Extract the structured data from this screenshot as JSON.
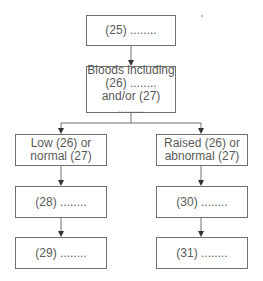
{
  "diagram": {
    "type": "flowchart",
    "nodes": [
      {
        "id": "n25",
        "label": "(25) ........"
      },
      {
        "id": "bloods",
        "line1": "Bloods including",
        "line2": "(26) ........",
        "line3": "and/or (27) ........"
      },
      {
        "id": "low",
        "line1": "Low (26) or",
        "line2": "normal (27)"
      },
      {
        "id": "raised",
        "line1": "Raised (26) or",
        "line2": "abnormal (27)"
      },
      {
        "id": "n28",
        "label": "(28) ........"
      },
      {
        "id": "n29",
        "label": "(29) ........"
      },
      {
        "id": "n30",
        "label": "(30) ........"
      },
      {
        "id": "n31",
        "label": "(31) ........"
      }
    ],
    "edges": [
      [
        "n25",
        "bloods"
      ],
      [
        "bloods",
        "low"
      ],
      [
        "bloods",
        "raised"
      ],
      [
        "low",
        "n28"
      ],
      [
        "n28",
        "n29"
      ],
      [
        "raised",
        "n30"
      ],
      [
        "n30",
        "n31"
      ]
    ],
    "colors": {
      "border": "#707070",
      "text": "#5a5a5a",
      "arrow": "#333333"
    }
  }
}
